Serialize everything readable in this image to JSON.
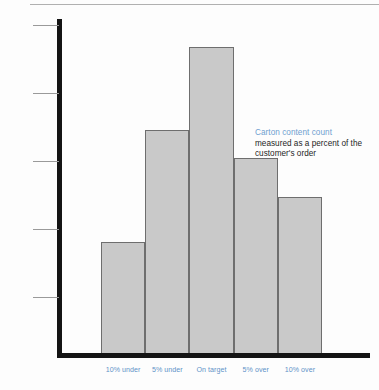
{
  "chart_data": {
    "type": "bar",
    "title": "Carton content count",
    "subtitle": "measured as a percent of the customer's order",
    "categories": [
      "10% under",
      "5% under",
      "On target",
      "5% over",
      "10% over"
    ],
    "values": [
      2.0,
      4.0,
      5.5,
      3.5,
      2.8
    ],
    "xlabel": "",
    "ylabel": "",
    "ylim": [
      0,
      6
    ],
    "yticks": [
      1,
      2,
      3,
      4,
      5
    ],
    "grid": false,
    "legend": "none",
    "bar_fill_color": "#c9c9c9",
    "bar_border_color": "#6e6e6e",
    "axis_color": "#141414",
    "tick_color": "#9a9a9a",
    "label_color": "#5f93c8",
    "annotation_title_color": "#6f9fd0",
    "annotation_body_color": "#1d1d1d"
  },
  "annotation": {
    "title": "Carton content count",
    "line1": "measured as a percent of the",
    "line2": "customer's order"
  }
}
